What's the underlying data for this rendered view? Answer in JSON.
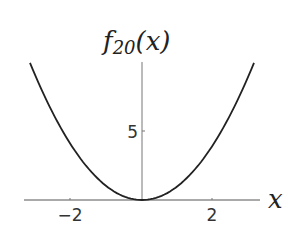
{
  "chart_data": {
    "type": "line",
    "title": "",
    "ylabel_main": "f",
    "ylabel_sub": "20",
    "ylabel_tail": "(x)",
    "xlabel": "x",
    "xlim": [
      -3.2,
      3.2
    ],
    "ylim": [
      0,
      10
    ],
    "x_ticks": [
      {
        "value": -2,
        "label": "−2"
      },
      {
        "value": 2,
        "label": "2"
      }
    ],
    "y_ticks": [
      {
        "value": 5,
        "label": "5"
      }
    ],
    "grid": false,
    "series": [
      {
        "name": "f20(x)",
        "x": [
          -3.2,
          -2.8,
          -2.4,
          -2.0,
          -1.6,
          -1.2,
          -0.8,
          -0.4,
          0,
          0.4,
          0.8,
          1.2,
          1.6,
          2.0,
          2.4,
          2.8,
          3.2
        ],
        "values": [
          10.24,
          7.84,
          5.76,
          4.0,
          2.56,
          1.44,
          0.64,
          0.16,
          0,
          0.16,
          0.64,
          1.44,
          2.56,
          4.0,
          5.76,
          7.84,
          10.24
        ]
      }
    ]
  }
}
